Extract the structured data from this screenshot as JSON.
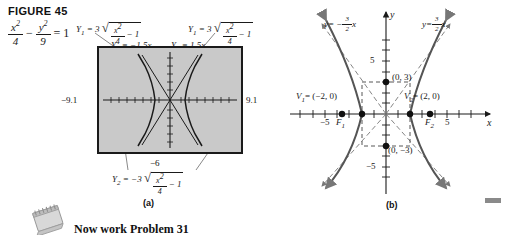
{
  "figure": {
    "title": "FIGURE 45",
    "equation": {
      "term1_num": "x",
      "term1_den": "4",
      "minus": "−",
      "term2_num": "y",
      "term2_den": "9",
      "equals": "= 1",
      "exponent": "2"
    }
  },
  "panel_a": {
    "caption": "(a)",
    "labels": {
      "y1_left": {
        "name": "Y",
        "sub": "1",
        "eq": "= 3",
        "radicand_num": "x",
        "radicand_den": "4",
        "tail": "− 1"
      },
      "y1_right": {
        "name": "Y",
        "sub": "1",
        "eq": "= 3",
        "radicand_num": "x",
        "radicand_den": "4",
        "tail": "− 1"
      },
      "y3": {
        "name": "Y",
        "sub": "3",
        "eq": "= −1.5x"
      },
      "y4": {
        "name": "Y",
        "sub": "4",
        "eq": "= 1.5x"
      },
      "y2": {
        "name": "Y",
        "sub": "2",
        "eq": "= −3",
        "radicand_num": "x",
        "radicand_den": "4",
        "tail": "− 1"
      }
    },
    "window": {
      "xmin": "−9.1",
      "xmax": "9.1",
      "ymin": "−6",
      "ymax": "6"
    },
    "colors": {
      "screen_bg": "#c9c9c9",
      "ink": "#1a1a1a"
    }
  },
  "panel_b": {
    "caption": "(b)",
    "axis_labels": {
      "x": "x",
      "y": "y"
    },
    "x_ticks": [
      {
        "value": -5,
        "label": "−5"
      },
      {
        "value": 5,
        "label": "5"
      }
    ],
    "y_ticks": [
      {
        "value": 5,
        "label": "5"
      },
      {
        "value": -5,
        "label": "−5"
      }
    ],
    "asymptotes": [
      {
        "name": "left-asymptote",
        "label_y": "y",
        "label_eq": "= −",
        "num": "3",
        "den": "2",
        "var": "x",
        "slope": -1.5
      },
      {
        "name": "right-asymptote",
        "label_y": "y",
        "label_eq": "=",
        "num": "3",
        "den": "2",
        "var": "x",
        "slope": 1.5
      }
    ],
    "points": [
      {
        "name": "vertex-1",
        "label": "V",
        "sub": "1",
        "eq": "= (−2, 0)",
        "x": -2,
        "y": 0
      },
      {
        "name": "vertex-2",
        "label": "V",
        "sub": "2",
        "eq": "= (2, 0)",
        "x": 2,
        "y": 0
      },
      {
        "name": "focus-1",
        "label": "F",
        "sub": "1",
        "eq": "",
        "x": -3.606,
        "y": 0
      },
      {
        "name": "focus-2",
        "label": "F",
        "sub": "2",
        "eq": "",
        "x": 3.606,
        "y": 0
      },
      {
        "name": "co-vertex-top",
        "label": "(0, 3)",
        "sub": "",
        "eq": "",
        "x": 0,
        "y": 3
      },
      {
        "name": "co-vertex-bottom",
        "label": "(0, −3)",
        "sub": "",
        "eq": "",
        "x": 0,
        "y": -3
      }
    ],
    "hyperbola": {
      "a": 2,
      "b": 3,
      "orientation": "horizontal"
    },
    "view": {
      "xmin": -7,
      "xmax": 7,
      "ymin": -7.5,
      "ymax": 7.5
    }
  },
  "footer": {
    "note": "Now work Problem 31"
  }
}
